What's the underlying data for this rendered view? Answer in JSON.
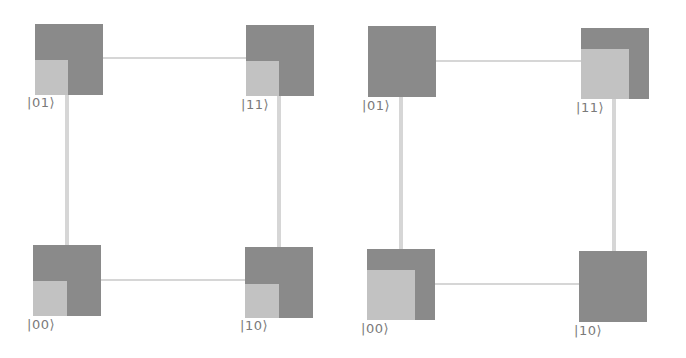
{
  "colors": {
    "node_dark": "#8a8a8a",
    "node_light": "#c2c2c2",
    "edge": "#d6d6d6",
    "label": "#7a7a7a"
  },
  "diagrams": [
    {
      "name": "left",
      "nodes": [
        {
          "label": "|01⟩",
          "fill_fraction": 0.5
        },
        {
          "label": "|11⟩",
          "fill_fraction": 0.5
        },
        {
          "label": "|00⟩",
          "fill_fraction": 0.5
        },
        {
          "label": "|10⟩",
          "fill_fraction": 0.5
        }
      ]
    },
    {
      "name": "right",
      "nodes": [
        {
          "label": "|01⟩",
          "fill_fraction": 0.0
        },
        {
          "label": "|11⟩",
          "fill_fraction": 0.7
        },
        {
          "label": "|00⟩",
          "fill_fraction": 0.7
        },
        {
          "label": "|10⟩",
          "fill_fraction": 0.0
        }
      ]
    }
  ]
}
